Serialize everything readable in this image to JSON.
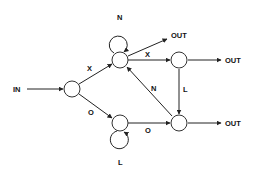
{
  "diagram": {
    "type": "state-machine",
    "colors": {
      "line": "#222222",
      "background": "#ffffff"
    },
    "input_label": "IN",
    "nodes": [
      {
        "id": "s0",
        "cx": 72,
        "cy": 89
      },
      {
        "id": "s1",
        "cx": 120,
        "cy": 60
      },
      {
        "id": "s2",
        "cx": 179,
        "cy": 60
      },
      {
        "id": "s3",
        "cx": 120,
        "cy": 123
      },
      {
        "id": "s4",
        "cx": 179,
        "cy": 123
      }
    ],
    "edges": [
      {
        "from": "IN",
        "to": "s0",
        "label": ""
      },
      {
        "from": "s0",
        "to": "s1",
        "label": "X"
      },
      {
        "from": "s0",
        "to": "s3",
        "label": "O"
      },
      {
        "from": "s1",
        "to": "s1",
        "label": "N"
      },
      {
        "from": "s1",
        "to": "OUT",
        "label": ""
      },
      {
        "from": "s1",
        "to": "s2",
        "label": "X"
      },
      {
        "from": "s2",
        "to": "OUT",
        "label": ""
      },
      {
        "from": "s2",
        "to": "s4",
        "label": "L"
      },
      {
        "from": "s4",
        "to": "s1",
        "label": "N"
      },
      {
        "from": "s3",
        "to": "s3",
        "label": "L"
      },
      {
        "from": "s3",
        "to": "s4",
        "label": "O"
      },
      {
        "from": "s4",
        "to": "OUT",
        "label": ""
      }
    ],
    "labels": {
      "in": "IN",
      "out_top": "OUT",
      "out_middle": "OUT",
      "out_bottom": "OUT",
      "edge_s0_s1": "X",
      "edge_s0_s3": "O",
      "loop_s1": "N",
      "edge_s1_s2": "X",
      "edge_s2_s4": "L",
      "edge_s4_s1": "N",
      "loop_s3": "L",
      "edge_s3_s4": "O"
    }
  }
}
